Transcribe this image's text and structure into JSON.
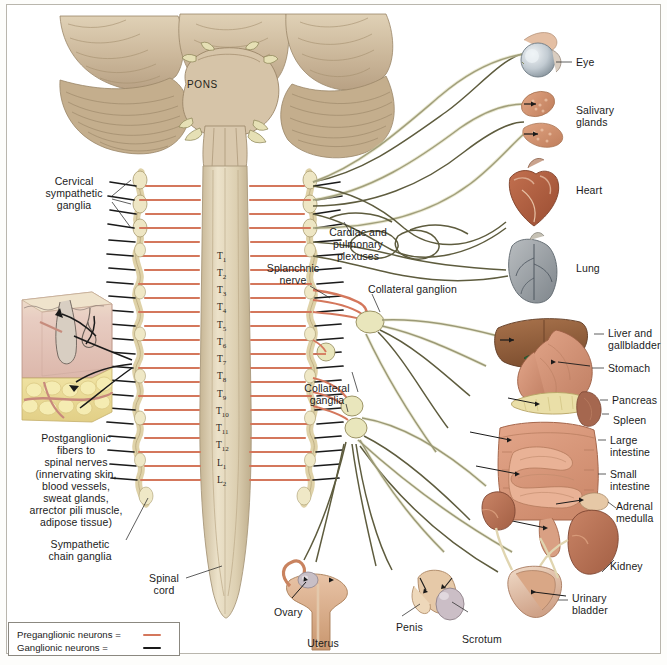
{
  "figure": {
    "pons_label": "PONS"
  },
  "left_labels": {
    "cervical_ganglia": "Cervical\nsympathetic\nganglia",
    "postganglionic": "Postganglionic\nfibers to\nspinal nerves\n(innervating skin,\nblood vessels,\nsweat glands,\narrector pili muscle,\nadipose tissue)",
    "chain_ganglia": "Sympathetic\nchain ganglia",
    "spinal_cord": "Spinal\ncord"
  },
  "center_labels": {
    "cardiac_pulmonary": "Cardiac and\npulmonary\nplexuses",
    "splanchnic_nerve": "Splanchnic\nnerve",
    "collateral_ganglion": "Collateral ganglion",
    "collateral_ganglia": "Collateral\nganglia"
  },
  "organ_labels": [
    {
      "id": "eye",
      "text": "Eye"
    },
    {
      "id": "salivary-glands",
      "text": "Salivary\nglands"
    },
    {
      "id": "heart",
      "text": "Heart"
    },
    {
      "id": "lung",
      "text": "Lung"
    },
    {
      "id": "liver-gallbladder",
      "text": "Liver and\ngallbladder"
    },
    {
      "id": "stomach",
      "text": "Stomach"
    },
    {
      "id": "pancreas",
      "text": "Pancreas"
    },
    {
      "id": "spleen",
      "text": "Spleen"
    },
    {
      "id": "large-intestine",
      "text": "Large\nintestine"
    },
    {
      "id": "small-intestine",
      "text": "Small\nintestine"
    },
    {
      "id": "adrenal-medulla",
      "text": "Adrenal\nmedulla"
    },
    {
      "id": "kidney",
      "text": "Kidney"
    },
    {
      "id": "urinary-bladder",
      "text": "Urinary\nbladder"
    },
    {
      "id": "ovary",
      "text": "Ovary"
    },
    {
      "id": "uterus",
      "text": "Uterus"
    },
    {
      "id": "penis",
      "text": "Penis"
    },
    {
      "id": "scrotum",
      "text": "Scrotum"
    }
  ],
  "vertebrae": [
    {
      "id": "T1",
      "main": "T",
      "sub": "1"
    },
    {
      "id": "T2",
      "main": "T",
      "sub": "2"
    },
    {
      "id": "T3",
      "main": "T",
      "sub": "3"
    },
    {
      "id": "T4",
      "main": "T",
      "sub": "4"
    },
    {
      "id": "T5",
      "main": "T",
      "sub": "5"
    },
    {
      "id": "T6",
      "main": "T",
      "sub": "6"
    },
    {
      "id": "T7",
      "main": "T",
      "sub": "7"
    },
    {
      "id": "T8",
      "main": "T",
      "sub": "8"
    },
    {
      "id": "T9",
      "main": "T",
      "sub": "9"
    },
    {
      "id": "T10",
      "main": "T",
      "sub": "10"
    },
    {
      "id": "T11",
      "main": "T",
      "sub": "11"
    },
    {
      "id": "T12",
      "main": "T",
      "sub": "12"
    },
    {
      "id": "L1",
      "main": "L",
      "sub": "1"
    },
    {
      "id": "L2",
      "main": "L",
      "sub": "2"
    }
  ],
  "legend": {
    "items": [
      {
        "id": "preganglionic",
        "label": "Preganglionic neurons =",
        "color": "#d4775c"
      },
      {
        "id": "ganglionic",
        "label": "Ganglionic neurons =",
        "color": "#1a1a1a"
      }
    ]
  },
  "colors": {
    "preganglionic": "#d4775c",
    "ganglionic": "#1a1a1a",
    "nerve_pale": "#d8d8b0",
    "ganglion_fill": "#e8e6bd",
    "cord": "#ded3bb",
    "brain": "#cfbda0",
    "frame": "#b9b6ad"
  }
}
